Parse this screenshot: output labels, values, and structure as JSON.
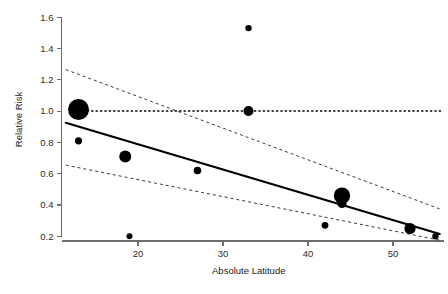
{
  "chart_data": {
    "type": "scatter",
    "title": "",
    "xlabel": "Absolute Latitude",
    "ylabel": "Relative Risk",
    "xlim": [
      11,
      56
    ],
    "ylim": [
      0.17,
      1.62
    ],
    "grid": false,
    "legend": null,
    "x_ticks": [
      20,
      30,
      40,
      50
    ],
    "x_tick_labels": [
      "20",
      "30",
      "40",
      "50"
    ],
    "y_ticks": [
      0.2,
      0.4,
      0.6,
      0.8,
      1.0,
      1.2,
      1.4,
      1.6
    ],
    "y_tick_labels": [
      "0.2",
      "0.4",
      "0.6",
      "0.8",
      "1.0",
      "1.2",
      "1.4",
      "1.6"
    ],
    "point_label": "study",
    "size_meaning": "study weight (inverse variance)",
    "points": [
      {
        "x": 13.0,
        "y": 1.01,
        "size": 10.5
      },
      {
        "x": 13.0,
        "y": 0.81,
        "size": 3.6
      },
      {
        "x": 18.5,
        "y": 0.71,
        "size": 6.0
      },
      {
        "x": 19.0,
        "y": 0.2,
        "size": 3.0
      },
      {
        "x": 27.0,
        "y": 0.62,
        "size": 3.8
      },
      {
        "x": 33.0,
        "y": 1.53,
        "size": 3.2
      },
      {
        "x": 33.0,
        "y": 1.0,
        "size": 5.0
      },
      {
        "x": 42.0,
        "y": 0.27,
        "size": 3.4
      },
      {
        "x": 44.0,
        "y": 0.46,
        "size": 8.2
      },
      {
        "x": 44.0,
        "y": 0.41,
        "size": 4.6
      },
      {
        "x": 52.0,
        "y": 0.25,
        "size": 5.6
      },
      {
        "x": 55.0,
        "y": 0.2,
        "size": 3.2
      }
    ],
    "fit_line": {
      "name": "meta-regression fit",
      "style": "solid",
      "x": [
        11.5,
        55.5
      ],
      "y": [
        0.925,
        0.215
      ]
    },
    "confidence_band_upper": {
      "name": "upper 95% confidence limit",
      "style": "dashed",
      "x": [
        11.5,
        55.5
      ],
      "y": [
        1.265,
        0.375
      ]
    },
    "confidence_band_lower": {
      "name": "lower 95% confidence limit",
      "style": "dashed",
      "x": [
        11.5,
        55.5
      ],
      "y": [
        0.655,
        0.175
      ]
    },
    "reference_line": {
      "name": "null effect reference",
      "style": "dotted",
      "y": 1.0,
      "x": [
        13.0,
        55.8
      ]
    },
    "colors": {
      "point": "#000000",
      "fit": "#000000",
      "confidence": "#3a3a3a",
      "reference": "#000000",
      "axis": "#6e6e6e",
      "background": "#ffffff"
    }
  }
}
